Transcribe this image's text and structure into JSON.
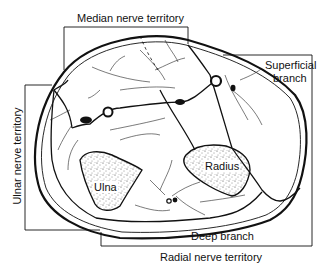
{
  "diagram": {
    "type": "anatomical cross-section",
    "labels": {
      "median": "Median nerve territory",
      "superficial": "Superficial",
      "superficial2": "branch",
      "ulnar": "Ulnar nerve territory",
      "radial": "Radial nerve territory",
      "deep": "Deep branch",
      "ulna": "Ulna",
      "radius": "Radius"
    },
    "colors": {
      "line": "#111111",
      "background": "#ffffff"
    }
  }
}
